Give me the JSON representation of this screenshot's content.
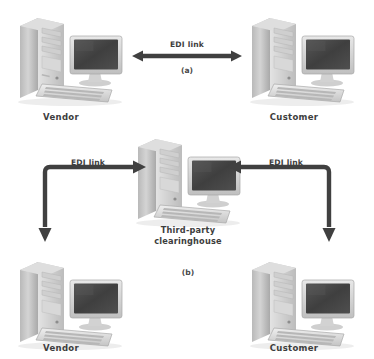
{
  "diagram": {
    "background_color": "#ffffff",
    "arrow_color": "#404040",
    "text_color": "#3d3d3d",
    "parts": [
      {
        "id": "a",
        "caption": "(a)",
        "nodes": [
          {
            "id": "vendor-a",
            "label": "Vendor",
            "icon": "computer-workstation-icon"
          },
          {
            "id": "customer-a",
            "label": "Customer",
            "icon": "computer-workstation-icon"
          }
        ],
        "links": [
          {
            "id": "edi-link-a",
            "label": "EDI link",
            "style": "double-headed-straight"
          }
        ]
      },
      {
        "id": "b",
        "caption": "(b)",
        "nodes": [
          {
            "id": "clearinghouse",
            "label_line1": "Third-party",
            "label_line2": "clearinghouse",
            "icon": "computer-workstation-icon"
          },
          {
            "id": "vendor-b",
            "label": "Vendor",
            "icon": "computer-workstation-icon"
          },
          {
            "id": "customer-b",
            "label": "Customer",
            "icon": "computer-workstation-icon"
          }
        ],
        "links": [
          {
            "id": "edi-link-b-left",
            "label": "EDI link",
            "style": "elbow-double-headed"
          },
          {
            "id": "edi-link-b-right",
            "label": "EDI link",
            "style": "elbow-double-headed"
          }
        ]
      }
    ]
  }
}
